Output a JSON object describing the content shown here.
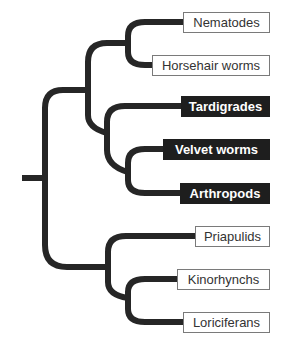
{
  "diagram": {
    "type": "phylogenetic-tree",
    "colors": {
      "branch": "#262626",
      "dark_box_bg": "#1e1e1e",
      "light_box_border": "#7a7a7a"
    },
    "taxa": [
      {
        "label": "Nematodes",
        "style": "light",
        "x": 183,
        "y": 12,
        "w": 87
      },
      {
        "label": "Horsehair worms",
        "style": "light",
        "x": 152,
        "y": 55,
        "w": 118
      },
      {
        "label": "Tardigrades",
        "style": "dark",
        "x": 181,
        "y": 96,
        "w": 89
      },
      {
        "label": "Velvet worms",
        "style": "dark",
        "x": 163,
        "y": 139,
        "w": 107
      },
      {
        "label": "Arthropods",
        "style": "dark",
        "x": 180,
        "y": 183,
        "w": 90
      },
      {
        "label": "Priapulids",
        "style": "light",
        "x": 195,
        "y": 226,
        "w": 75
      },
      {
        "label": "Kinorhynchs",
        "style": "light",
        "x": 177,
        "y": 269,
        "w": 93
      },
      {
        "label": "Loriciferans",
        "style": "light",
        "x": 183,
        "y": 312,
        "w": 87
      }
    ]
  }
}
